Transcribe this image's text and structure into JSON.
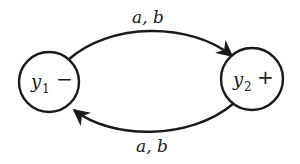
{
  "diagram": {
    "type": "finite-automaton",
    "states": [
      {
        "id": "y1",
        "name": "y",
        "subscript": "1",
        "marker": "−",
        "role": "start"
      },
      {
        "id": "y2",
        "name": "y",
        "subscript": "2",
        "marker": "+",
        "role": "final"
      }
    ],
    "transitions": [
      {
        "from": "y1",
        "to": "y2",
        "label": "a, b"
      },
      {
        "from": "y2",
        "to": "y1",
        "label": "a, b"
      }
    ],
    "colors": {
      "stroke": "#1a1a1a",
      "background": "#ffffff"
    }
  }
}
